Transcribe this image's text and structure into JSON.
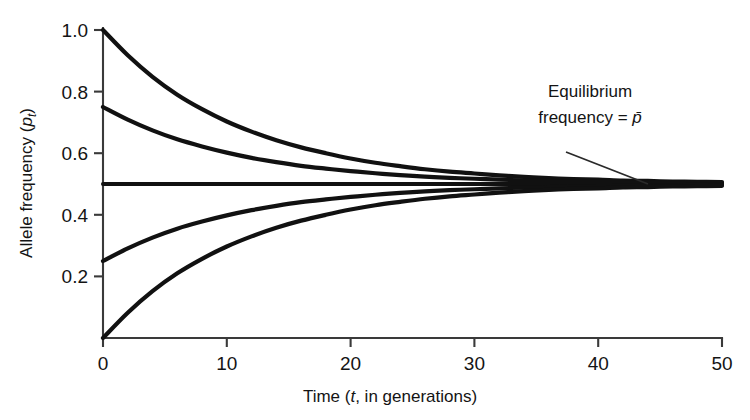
{
  "chart_data": {
    "type": "line",
    "title": "",
    "xlabel": "Time (t, in generations)",
    "xlabel_parts": {
      "prefix": "Time (",
      "italic": "t",
      "suffix": ", in generations)"
    },
    "ylabel": "Allele frequency (p_t)",
    "ylabel_parts": {
      "prefix": "Allele frequency (",
      "italic": "p",
      "subscript": "t",
      "suffix": ")"
    },
    "xlim": [
      0,
      50
    ],
    "ylim": [
      0,
      1.0
    ],
    "xticks": [
      0,
      10,
      20,
      30,
      40,
      50
    ],
    "xtick_labels": [
      "0",
      "10",
      "20",
      "30",
      "40",
      "50"
    ],
    "yticks": [
      0.2,
      0.4,
      0.6,
      0.8,
      1.0
    ],
    "ytick_labels": [
      "0.2",
      "0.4",
      "0.6",
      "0.8",
      "1.0"
    ],
    "grid": false,
    "legend": "none",
    "equilibrium": 0.5,
    "decay_rate": 0.09,
    "x": [
      0,
      2,
      4,
      6,
      8,
      10,
      12,
      14,
      16,
      18,
      20,
      22,
      24,
      26,
      28,
      30,
      32,
      34,
      36,
      38,
      40,
      42,
      44,
      46,
      48,
      50
    ],
    "series": [
      {
        "name": "p0 = 1.00",
        "p0": 1.0,
        "values": [
          1.0,
          0.918,
          0.848,
          0.79,
          0.743,
          0.703,
          0.67,
          0.642,
          0.619,
          0.6,
          0.583,
          0.569,
          0.558,
          0.548,
          0.54,
          0.534,
          0.528,
          0.523,
          0.519,
          0.516,
          0.514,
          0.511,
          0.51,
          0.508,
          0.507,
          0.506
        ]
      },
      {
        "name": "p0 = 0.75",
        "p0": 0.75,
        "values": [
          0.75,
          0.709,
          0.674,
          0.645,
          0.622,
          0.602,
          0.585,
          0.571,
          0.559,
          0.55,
          0.542,
          0.535,
          0.529,
          0.524,
          0.52,
          0.517,
          0.514,
          0.512,
          0.51,
          0.508,
          0.507,
          0.506,
          0.505,
          0.504,
          0.503,
          0.503
        ]
      },
      {
        "name": "p0 = 0.50 (equilibrium)",
        "p0": 0.5,
        "values": [
          0.5,
          0.5,
          0.5,
          0.5,
          0.5,
          0.5,
          0.5,
          0.5,
          0.5,
          0.5,
          0.5,
          0.5,
          0.5,
          0.5,
          0.5,
          0.5,
          0.5,
          0.5,
          0.5,
          0.5,
          0.5,
          0.5,
          0.5,
          0.5,
          0.5,
          0.5
        ]
      },
      {
        "name": "p0 = 0.25",
        "p0": 0.25,
        "values": [
          0.25,
          0.291,
          0.326,
          0.355,
          0.378,
          0.398,
          0.415,
          0.429,
          0.441,
          0.45,
          0.458,
          0.465,
          0.471,
          0.476,
          0.48,
          0.483,
          0.486,
          0.488,
          0.49,
          0.492,
          0.493,
          0.494,
          0.495,
          0.496,
          0.497,
          0.497
        ]
      },
      {
        "name": "p0 = 0.00",
        "p0": 0.0,
        "values": [
          0.0,
          0.082,
          0.152,
          0.21,
          0.257,
          0.297,
          0.33,
          0.358,
          0.381,
          0.4,
          0.417,
          0.431,
          0.442,
          0.452,
          0.46,
          0.466,
          0.472,
          0.477,
          0.481,
          0.484,
          0.486,
          0.489,
          0.49,
          0.492,
          0.493,
          0.494
        ]
      }
    ],
    "annotations": [
      {
        "name": "equilibrium-annotation",
        "line1": "Equilibrium",
        "line2_prefix": "frequency = ",
        "line2_symbol": "p̄",
        "target_value": 0.5
      }
    ]
  }
}
